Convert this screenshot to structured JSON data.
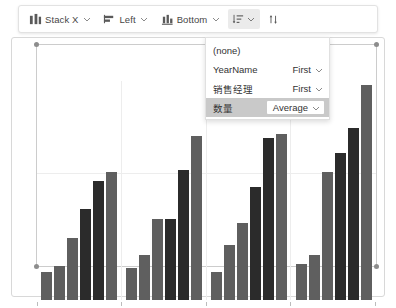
{
  "toolbar": {
    "items": [
      {
        "icon": "stack-x-icon",
        "label": "Stack X",
        "has_chevron": true,
        "active": false
      },
      {
        "icon": "align-left-icon",
        "label": "Left",
        "has_chevron": true,
        "active": false
      },
      {
        "icon": "align-bottom-icon",
        "label": "Bottom",
        "has_chevron": true,
        "active": false
      },
      {
        "icon": "sort-descending-icon",
        "label": "",
        "has_chevron": true,
        "active": true
      },
      {
        "icon": "sort-updown-icon",
        "label": "",
        "has_chevron": false,
        "active": false
      }
    ]
  },
  "dropdown": {
    "rows": [
      {
        "name": "(none)",
        "agg": "",
        "has_chevron": false,
        "selected": false
      },
      {
        "name": "YearName",
        "agg": "First",
        "has_chevron": true,
        "selected": false
      },
      {
        "name": "销售经理",
        "agg": "First",
        "has_chevron": true,
        "selected": false
      },
      {
        "name": "数量",
        "agg": "Average",
        "has_chevron": true,
        "selected": true
      }
    ]
  },
  "colors": {
    "bar_light": "#5f5f5f",
    "bar_dark": "#2b2b2b",
    "grid": "#ededed",
    "selected_row": "#c9c9c9",
    "toolbar_active": "#ebebeb"
  },
  "chart_data": {
    "type": "bar",
    "title": "",
    "xlabel": "",
    "ylabel": "",
    "grid": true,
    "legend": "none",
    "categories": [
      "Y2017",
      "Y2018",
      "Y2019",
      "Y2020"
    ],
    "series": [
      {
        "name": "bar-1",
        "shade": "light",
        "values": [
          13,
          15,
          13,
          17
        ]
      },
      {
        "name": "bar-2",
        "shade": "light",
        "values": [
          16,
          21,
          26,
          21
        ]
      },
      {
        "name": "bar-3",
        "shade": "light",
        "values": [
          29,
          38,
          36,
          60
        ]
      },
      {
        "name": "bar-4",
        "shade": "dark",
        "values": [
          43,
          38,
          53,
          69
        ]
      },
      {
        "name": "bar-5",
        "shade": "dark",
        "values": [
          56,
          61,
          76,
          81
        ]
      },
      {
        "name": "bar-6",
        "shade": "light",
        "values": [
          60,
          77,
          78,
          101
        ]
      }
    ],
    "ylim": [
      0,
      103
    ],
    "gridline_values": [
      44
    ]
  }
}
